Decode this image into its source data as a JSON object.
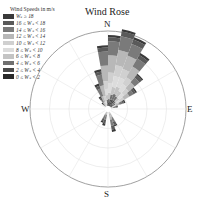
{
  "chart_data": {
    "type": "wind_rose",
    "title": "Wind Rose",
    "legend_title": "Wind Speeds in m/s",
    "directions": [
      "N",
      "E",
      "S",
      "W"
    ],
    "rings": 4,
    "grid": true,
    "legend": [
      {
        "label": "Wₛ ≥ 18",
        "color": "#3a3a3a"
      },
      {
        "label": "16 ≤ Wₛ < 18",
        "color": "#5a5a5a"
      },
      {
        "label": "14 ≤ Wₛ < 16",
        "color": "#7a7a7a"
      },
      {
        "label": "12 ≤ Wₛ < 14",
        "color": "#b8b8b8"
      },
      {
        "label": "10 ≤ Wₛ < 12",
        "color": "#d0d0d0"
      },
      {
        "label": "8 ≤ Wₛ < 10",
        "color": "#dcdcdc"
      },
      {
        "label": "6 ≤ Wₛ < 8",
        "color": "#c4c4c4"
      },
      {
        "label": "4 ≤ Wₛ < 6",
        "color": "#707070"
      },
      {
        "label": "2 ≤ Wₛ < 4",
        "color": "#4a4a4a"
      },
      {
        "label": "0 ≤ Wₛ < 2",
        "color": "#2a2a2a"
      }
    ],
    "sector_width_deg": 10,
    "sectors": [
      {
        "dir": 355,
        "bins": [
          0.03,
          0.05,
          0.18,
          0.2,
          0.1,
          0.08,
          0.06,
          0.05,
          0.03,
          0.0
        ]
      },
      {
        "dir": 5,
        "bins": [
          0.03,
          0.05,
          0.18,
          0.22,
          0.14,
          0.12,
          0.08,
          0.05,
          0.03,
          0.01
        ]
      },
      {
        "dir": 15,
        "bins": [
          0.03,
          0.06,
          0.18,
          0.2,
          0.14,
          0.14,
          0.1,
          0.06,
          0.06,
          0.03
        ]
      },
      {
        "dir": 25,
        "bins": [
          0.03,
          0.06,
          0.16,
          0.18,
          0.12,
          0.12,
          0.1,
          0.08,
          0.06,
          0.03
        ]
      },
      {
        "dir": 35,
        "bins": [
          0.03,
          0.05,
          0.12,
          0.16,
          0.1,
          0.1,
          0.08,
          0.06,
          0.07,
          0.02
        ]
      },
      {
        "dir": 45,
        "bins": [
          0.02,
          0.04,
          0.08,
          0.1,
          0.08,
          0.08,
          0.06,
          0.05,
          0.04,
          0.0
        ]
      },
      {
        "dir": 55,
        "bins": [
          0.02,
          0.03,
          0.06,
          0.08,
          0.06,
          0.04,
          0.03,
          0.03,
          0.04,
          0.0
        ]
      },
      {
        "dir": 65,
        "bins": [
          0.02,
          0.02,
          0.04,
          0.05,
          0.03,
          0.02,
          0.02,
          0.0,
          0.0,
          0.0
        ]
      },
      {
        "dir": 75,
        "bins": [
          0.01,
          0.02,
          0.03,
          0.02,
          0.01,
          0.0,
          0.0,
          0.0,
          0.0,
          0.0
        ]
      },
      {
        "dir": 345,
        "bins": [
          0.03,
          0.04,
          0.14,
          0.14,
          0.06,
          0.04,
          0.02,
          0.01,
          0.0,
          0.0
        ]
      },
      {
        "dir": 335,
        "bins": [
          0.03,
          0.04,
          0.1,
          0.08,
          0.04,
          0.02,
          0.0,
          0.0,
          0.0,
          0.0
        ]
      },
      {
        "dir": 325,
        "bins": [
          0.02,
          0.03,
          0.04,
          0.04,
          0.02,
          0.0,
          0.0,
          0.0,
          0.0,
          0.0
        ]
      },
      {
        "dir": 315,
        "bins": [
          0.02,
          0.02,
          0.02,
          0.01,
          0.0,
          0.0,
          0.0,
          0.0,
          0.0,
          0.0
        ]
      },
      {
        "dir": 155,
        "bins": [
          0.02,
          0.04,
          0.06,
          0.06,
          0.02,
          0.0,
          0.0,
          0.0,
          0.0,
          0.0
        ]
      },
      {
        "dir": 165,
        "bins": [
          0.03,
          0.05,
          0.08,
          0.08,
          0.02,
          0.0,
          0.0,
          0.0,
          0.0,
          0.0
        ]
      },
      {
        "dir": 195,
        "bins": [
          0.03,
          0.05,
          0.06,
          0.04,
          0.0,
          0.0,
          0.0,
          0.0,
          0.0,
          0.0
        ]
      },
      {
        "dir": 205,
        "bins": [
          0.02,
          0.04,
          0.05,
          0.04,
          0.0,
          0.0,
          0.0,
          0.0,
          0.0,
          0.0
        ]
      }
    ],
    "max_radius_value": 1.0
  }
}
